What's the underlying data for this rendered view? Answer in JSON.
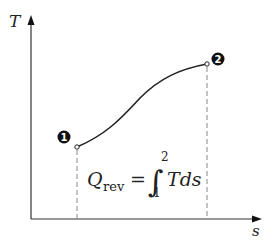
{
  "diagram": {
    "axes": {
      "y_label": "T",
      "x_label": "s"
    },
    "points": [
      {
        "id": "1",
        "label": "1"
      },
      {
        "id": "2",
        "label": "2"
      }
    ],
    "equation": {
      "lhs": "Q",
      "lhs_sub": "rev",
      "eq": "=",
      "integral": "∫",
      "lower": "1",
      "upper": "2",
      "integrand": "Tds"
    },
    "colors": {
      "line": "#222222",
      "dashed": "#888888",
      "marker_fill": "#111111"
    }
  }
}
